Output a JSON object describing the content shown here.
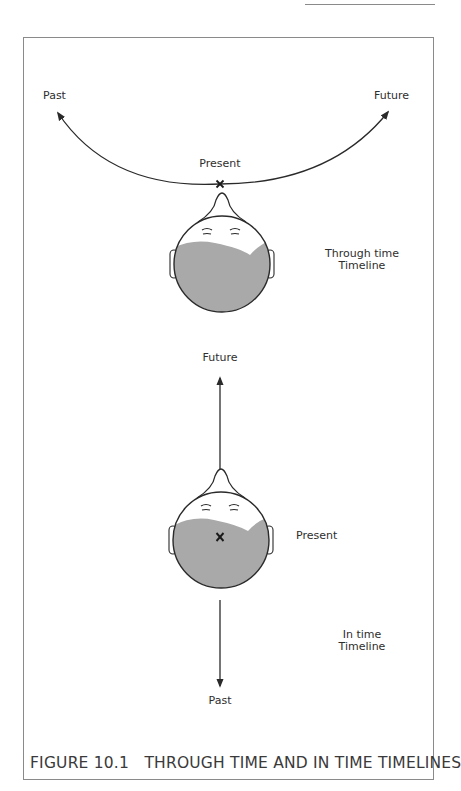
{
  "figure": {
    "caption": "FIGURE 10.1   THROUGH TIME AND IN TIME TIMELINES"
  },
  "through_time": {
    "past_label": "Past",
    "future_label": "Future",
    "present_label": "Present",
    "marker": "X",
    "title_line1": "Through time",
    "title_line2": "Timeline"
  },
  "in_time": {
    "future_label": "Future",
    "present_label": "Present",
    "past_label": "Past",
    "marker": "X",
    "title_line1": "In time",
    "title_line2": "Timeline"
  },
  "colors": {
    "line": "#2a2a2a",
    "hair_fill": "#a9a9a9",
    "frame": "#8a8a8a"
  }
}
